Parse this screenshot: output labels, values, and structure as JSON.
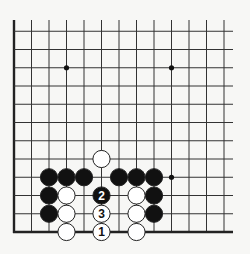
{
  "board": {
    "background": "#f7f7f5",
    "line_color": "#333333",
    "border_color": "#222222",
    "edges_shown": [
      "left",
      "bottom"
    ],
    "grid": {
      "x0": 14,
      "col_spacing": 17.5,
      "cols": 13,
      "y_bottom": 232,
      "row_spacing": 18.25,
      "rows": 12,
      "line_top": 20,
      "line_right": 233
    },
    "star_points": [
      {
        "col": 3,
        "row": 9
      },
      {
        "col": 9,
        "row": 9
      },
      {
        "col": 9,
        "row": 3
      }
    ],
    "stones": [
      {
        "color": "black",
        "col": 2,
        "row": 3
      },
      {
        "color": "black",
        "col": 3,
        "row": 3
      },
      {
        "color": "black",
        "col": 4,
        "row": 3
      },
      {
        "color": "black",
        "col": 6,
        "row": 3
      },
      {
        "color": "black",
        "col": 7,
        "row": 3
      },
      {
        "color": "black",
        "col": 8,
        "row": 3
      },
      {
        "color": "black",
        "col": 2,
        "row": 2
      },
      {
        "color": "black",
        "col": 2,
        "row": 1
      },
      {
        "color": "black",
        "col": 8,
        "row": 2
      },
      {
        "color": "black",
        "col": 8,
        "row": 1
      },
      {
        "color": "white",
        "col": 5,
        "row": 4
      },
      {
        "color": "white",
        "col": 3,
        "row": 2
      },
      {
        "color": "white",
        "col": 3,
        "row": 1
      },
      {
        "color": "white",
        "col": 3,
        "row": 0
      },
      {
        "color": "white",
        "col": 7,
        "row": 2
      },
      {
        "color": "white",
        "col": 7,
        "row": 1
      },
      {
        "color": "white",
        "col": 7,
        "row": 0
      },
      {
        "color": "black",
        "col": 5,
        "row": 2,
        "label": "2"
      },
      {
        "color": "white",
        "col": 5,
        "row": 1,
        "label": "3"
      },
      {
        "color": "white",
        "col": 5,
        "row": 0,
        "label": "1"
      }
    ],
    "move_sequence": [
      {
        "move": "1",
        "color": "white"
      },
      {
        "move": "2",
        "color": "black"
      },
      {
        "move": "3",
        "color": "white"
      }
    ]
  }
}
